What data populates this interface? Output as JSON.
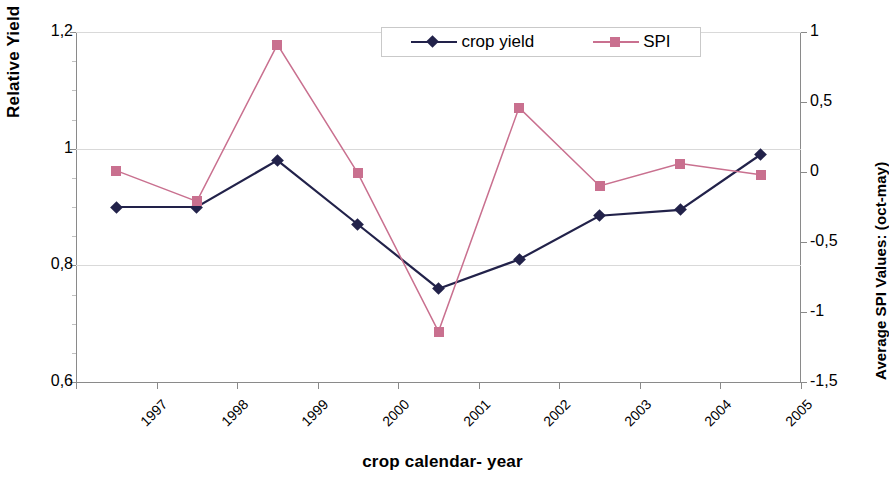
{
  "axes": {
    "y_left_title": "Relative Yield",
    "y_right_title": "Average SPI Values: (oct-may)",
    "x_title": "crop calendar- year",
    "y_left_ticks": [
      "0,6",
      "0,8",
      "1",
      "1,2"
    ],
    "y_right_ticks": [
      "-1,5",
      "-1",
      "-0,5",
      "0",
      "0,5",
      "1"
    ]
  },
  "legend": {
    "position": "top-right-inside",
    "entries": [
      {
        "label": "crop yield",
        "color": "#22224a",
        "marker": "diamond"
      },
      {
        "label": "SPI",
        "color": "#c9708f",
        "marker": "square"
      }
    ]
  },
  "colors": {
    "crop_yield": "#22224a",
    "spi": "#c9708f",
    "gridline": "#d9d9d9",
    "axis": "#8a8a8a",
    "background": "#ffffff"
  },
  "chart_data": {
    "type": "line",
    "title": "",
    "xlabel": "crop calendar- year",
    "ylabel": "Relative Yield",
    "y2label": "Average SPI Values: (oct-may)",
    "categories": [
      "1997",
      "1998",
      "1999",
      "2000",
      "2001",
      "2002",
      "2003",
      "2004",
      "2005"
    ],
    "ylim": [
      0.6,
      1.2
    ],
    "y2lim": [
      -1.5,
      1.0
    ],
    "yticks": [
      0.6,
      0.8,
      1.0,
      1.2
    ],
    "y2ticks": [
      -1.5,
      -1.0,
      -0.5,
      0.0,
      0.5,
      1.0
    ],
    "grid": true,
    "legend_position": "top right",
    "series": [
      {
        "name": "crop yield",
        "axis": "left",
        "color": "#22224a",
        "marker": "diamond",
        "values": [
          0.9,
          0.9,
          0.98,
          0.87,
          0.76,
          0.81,
          0.885,
          0.895,
          0.99
        ]
      },
      {
        "name": "SPI",
        "axis": "right",
        "color": "#c9708f",
        "marker": "square",
        "values": [
          0.01,
          -0.21,
          0.91,
          -0.01,
          -1.14,
          0.46,
          -0.1,
          0.06,
          -0.02
        ]
      }
    ]
  }
}
